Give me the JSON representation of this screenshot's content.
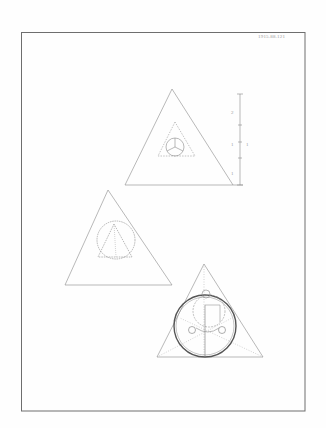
{
  "document": {
    "type": "pencil geometry drawing sheet",
    "catalog_number": "1915.88.121",
    "scale_labels": [
      "2",
      "1",
      "1"
    ],
    "colors": {
      "background": "#ffffff",
      "border": "#6e6e6e",
      "pencil": "#8a8a8a",
      "pencil_dark": "#555555",
      "pencil_light": "#b5b5b5"
    }
  },
  "figures": [
    {
      "name": "top-triangle",
      "description": "Equilateral triangle with small inscribed triangle and incircle with three radii"
    },
    {
      "name": "middle-triangle",
      "description": "Equilateral triangle with circle containing inscribed triangle"
    },
    {
      "name": "bottom-triangle",
      "description": "Equilateral triangle with large heavy incircle, inner circle, and two small circles"
    }
  ]
}
